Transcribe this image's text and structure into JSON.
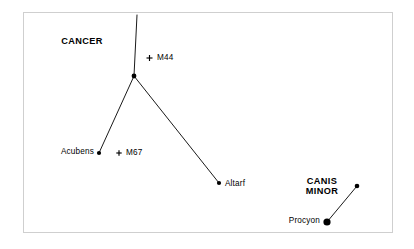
{
  "figure": {
    "kind": "star-chart",
    "background_color": "#ffffff",
    "ink_color": "#000000",
    "frame": {
      "visible": true,
      "color": "#cfcfcf",
      "x": 23,
      "y": 12,
      "width": 369,
      "height": 220
    }
  },
  "chart_data": {
    "type": "scatter",
    "title": "",
    "xlabel": "",
    "ylabel": "",
    "xlim": [
      0,
      414
    ],
    "ylim": [
      249,
      0
    ],
    "grid": false,
    "legend": "none",
    "constellations": [
      {
        "name": "CANCER",
        "label": "CANCER",
        "label_x": 82,
        "label_y": 41,
        "label_anchor": "center"
      },
      {
        "name": "CANIS MINOR",
        "label_line1": "CANIS",
        "label_line2": "MINOR",
        "label_x": 322,
        "label_y": 186,
        "label_anchor": "center"
      }
    ],
    "stars": [
      {
        "id": "asellus",
        "label": "",
        "x": 134,
        "y": 76,
        "radius": 2.4,
        "constellation": "CANCER",
        "label_anchor": "none"
      },
      {
        "id": "acubens",
        "label": "Acubens",
        "x": 99,
        "y": 153,
        "radius": 2.1,
        "constellation": "CANCER",
        "label_anchor": "right",
        "label_x": 94,
        "label_y": 152
      },
      {
        "id": "altarf",
        "label": "Altarf",
        "x": 219,
        "y": 183,
        "radius": 2.1,
        "constellation": "CANCER",
        "label_anchor": "left",
        "label_x": 225,
        "label_y": 184
      },
      {
        "id": "procyon",
        "label": "Procyon",
        "x": 327,
        "y": 222,
        "radius": 3.6,
        "constellation": "CANIS MINOR",
        "label_anchor": "right",
        "label_x": 320,
        "label_y": 221
      },
      {
        "id": "gomeisa",
        "label": "",
        "x": 357,
        "y": 186,
        "radius": 2.3,
        "constellation": "CANIS MINOR",
        "label_anchor": "none"
      }
    ],
    "deep_sky_objects": [
      {
        "id": "m44",
        "label": "M44",
        "marker": "plus",
        "x": 149.5,
        "y": 58,
        "size": 6,
        "label_anchor": "left",
        "label_x": 157,
        "label_y": 58
      },
      {
        "id": "m67",
        "label": "M67",
        "marker": "plus",
        "x": 119,
        "y": 153,
        "size": 5.4,
        "label_anchor": "left",
        "label_x": 126,
        "label_y": 153
      }
    ],
    "lines": [
      {
        "id": "line-asellus-north",
        "from": "asellus",
        "x1": 134,
        "y1": 76,
        "x2": 137,
        "y2": 15,
        "width": 0.9
      },
      {
        "id": "line-asellus-acubens",
        "from": "asellus",
        "to": "acubens",
        "x1": 134,
        "y1": 76,
        "x2": 99,
        "y2": 153,
        "width": 0.9
      },
      {
        "id": "line-asellus-altarf",
        "from": "asellus",
        "to": "altarf",
        "x1": 134,
        "y1": 76,
        "x2": 219,
        "y2": 183,
        "width": 0.9
      },
      {
        "id": "line-procyon-gomeisa",
        "from": "procyon",
        "to": "gomeisa",
        "x1": 327,
        "y1": 222,
        "x2": 357,
        "y2": 186,
        "width": 0.9
      }
    ]
  }
}
